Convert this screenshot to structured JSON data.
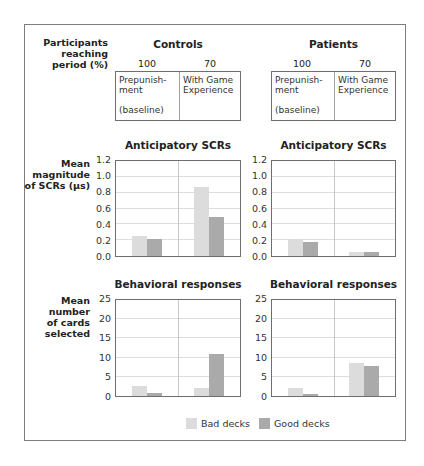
{
  "header": {
    "row_label": [
      "Participants",
      "reaching",
      "period (%)"
    ],
    "groups": [
      {
        "name": "Controls",
        "percentages": [
          "100",
          "70"
        ],
        "periods": [
          {
            "line1": "Prepunish-",
            "line2": "ment",
            "line3": "(baseline)"
          },
          {
            "line1": "With Game",
            "line2": "Experience",
            "line3": ""
          }
        ]
      },
      {
        "name": "Patients",
        "percentages": [
          "100",
          "70"
        ],
        "periods": [
          {
            "line1": "Prepunish-",
            "line2": "ment",
            "line3": "(baseline)"
          },
          {
            "line1": "With Game",
            "line2": "Experience",
            "line3": ""
          }
        ]
      }
    ]
  },
  "row_labels": {
    "scr": [
      "Mean",
      "magnitude",
      "of SCRs (μs)"
    ],
    "cards": [
      "Mean",
      "number",
      "of cards",
      "selected"
    ]
  },
  "legend": {
    "bad": "Bad decks",
    "good": "Good decks"
  },
  "colors": {
    "bad": "#dcdcdc",
    "good": "#aaaaaa"
  },
  "chart_data": [
    {
      "type": "bar",
      "title": "Anticipatory SCRs",
      "group": "Controls",
      "ylabel": "Mean magnitude of SCRs (μs)",
      "ylim": [
        0,
        1.2
      ],
      "yticks": [
        "0.0",
        "0.2",
        "0.4",
        "0.6",
        "0.8",
        "1.0",
        "1.2"
      ],
      "categories": [
        "Prepunishment (baseline)",
        "With Game Experience"
      ],
      "series": [
        {
          "name": "Bad decks",
          "values": [
            0.25,
            0.87
          ]
        },
        {
          "name": "Good decks",
          "values": [
            0.21,
            0.49
          ]
        }
      ]
    },
    {
      "type": "bar",
      "title": "Anticipatory SCRs",
      "group": "Patients",
      "ylabel": "Mean magnitude of SCRs (μs)",
      "ylim": [
        0,
        1.2
      ],
      "yticks": [
        "0.0",
        "0.2",
        "0.4",
        "0.6",
        "0.8",
        "1.0",
        "1.2"
      ],
      "categories": [
        "Prepunishment (baseline)",
        "With Game Experience"
      ],
      "series": [
        {
          "name": "Bad decks",
          "values": [
            0.21,
            0.05
          ]
        },
        {
          "name": "Good decks",
          "values": [
            0.18,
            0.05
          ]
        }
      ]
    },
    {
      "type": "bar",
      "title": "Behavioral responses",
      "group": "Controls",
      "ylabel": "Mean number of cards selected",
      "ylim": [
        0,
        25
      ],
      "yticks": [
        "0",
        "5",
        "10",
        "15",
        "20",
        "25"
      ],
      "categories": [
        "Prepunishment (baseline)",
        "With Game Experience"
      ],
      "series": [
        {
          "name": "Bad decks",
          "values": [
            2.5,
            2.2
          ]
        },
        {
          "name": "Good decks",
          "values": [
            0.8,
            11
          ]
        }
      ]
    },
    {
      "type": "bar",
      "title": "Behavioral responses",
      "group": "Patients",
      "ylabel": "Mean number of cards selected",
      "ylim": [
        0,
        25
      ],
      "yticks": [
        "0",
        "5",
        "10",
        "15",
        "20",
        "25"
      ],
      "categories": [
        "Prepunishment (baseline)",
        "With Game Experience"
      ],
      "series": [
        {
          "name": "Bad decks",
          "values": [
            2.1,
            8.5
          ]
        },
        {
          "name": "Good decks",
          "values": [
            0.6,
            7.9
          ]
        }
      ]
    }
  ]
}
